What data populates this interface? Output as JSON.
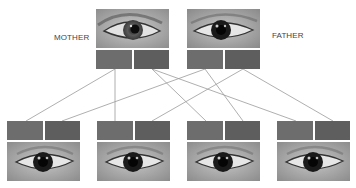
{
  "labels": {
    "mother": "MOTHER",
    "father": "FATHER"
  },
  "colors": {
    "gene_left": "#6d6d6d",
    "gene_right": "#5e5e5e",
    "line": "#9a9a9a",
    "eye_bg": "#a9a9a9",
    "parent_eye_bg": "#b4b4b4"
  },
  "parents": [
    {
      "id": "mother",
      "x": 96,
      "y": 9,
      "eye": "light",
      "genes": [
        "gene-1",
        "gene-2"
      ]
    },
    {
      "id": "father",
      "x": 187,
      "y": 9,
      "eye": "dark",
      "genes": [
        "gene-1",
        "gene-2"
      ]
    }
  ],
  "children": [
    {
      "id": "child-1",
      "x": 7,
      "y": 121,
      "eye": "dark"
    },
    {
      "id": "child-2",
      "x": 97,
      "y": 121,
      "eye": "dark"
    },
    {
      "id": "child-3",
      "x": 187,
      "y": 121,
      "eye": "dark"
    },
    {
      "id": "child-4",
      "x": 277,
      "y": 121,
      "eye": "dark"
    }
  ],
  "connections": [
    {
      "from": "mother.gene-1",
      "to": "child-1.gene-1"
    },
    {
      "from": "mother.gene-1",
      "to": "child-2.gene-1"
    },
    {
      "from": "mother.gene-2",
      "to": "child-3.gene-1"
    },
    {
      "from": "mother.gene-2",
      "to": "child-4.gene-1"
    },
    {
      "from": "father.gene-1",
      "to": "child-1.gene-2"
    },
    {
      "from": "father.gene-1",
      "to": "child-3.gene-2"
    },
    {
      "from": "father.gene-2",
      "to": "child-2.gene-2"
    },
    {
      "from": "father.gene-2",
      "to": "child-4.gene-2"
    }
  ]
}
